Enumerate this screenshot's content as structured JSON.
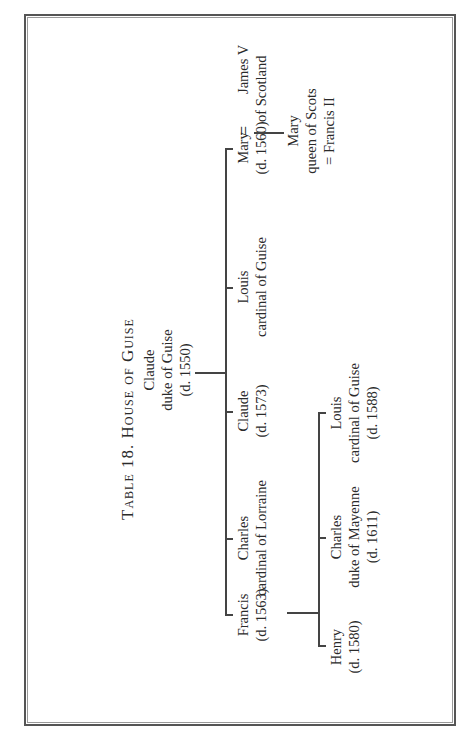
{
  "table": {
    "title": "Table 18.  House of Guise",
    "root": {
      "name": "Claude",
      "title": "duke of Guise",
      "dates": "(d. 1550)"
    },
    "children": [
      {
        "name": "Francis",
        "dates": "(d. 1563)"
      },
      {
        "name": "Charles",
        "title": "cardinal of Lorraine"
      },
      {
        "name": "Claude",
        "dates": "(d. 1573)"
      },
      {
        "name": "Louis",
        "title": "cardinal of Guise"
      },
      {
        "name": "Mary",
        "dates": "(d. 1560)",
        "marriage_symbol": "=",
        "spouse": {
          "name": "James V",
          "title": "of Scotland"
        }
      }
    ],
    "mary_child": {
      "name": "Mary",
      "title": "queen of Scots",
      "spouse": "= Francis II"
    },
    "grandchildren_of_francis": [
      {
        "name": "Henry",
        "dates": "(d. 1580)"
      },
      {
        "name": "Charles",
        "title": "duke of Mayenne",
        "dates": "(d. 1611)"
      },
      {
        "name": "Louis",
        "title": "cardinal of Guise",
        "dates": "(d. 1588)"
      }
    ]
  }
}
